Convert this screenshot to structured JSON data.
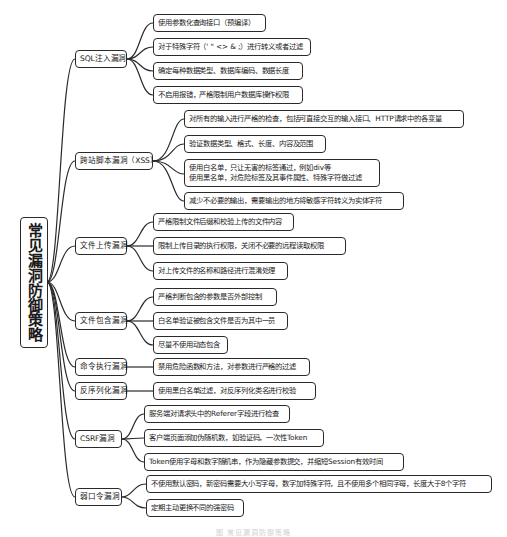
{
  "root": {
    "label": "常见漏洞防御策略"
  },
  "categories": [
    {
      "label": "SQL注入漏洞",
      "items": [
        "使用参数化查询接口（预编译）",
        "对于特殊字符（' \" <> & ;）进行转义或者过滤",
        "确定每种数据类型、数据库编码、数据长度",
        "不启用报错，严格限制用户数据库操作权限"
      ]
    },
    {
      "label": "跨站脚本漏洞（XSS）",
      "items": [
        "对所有的输入进行严格的检查，包括可直接交互的输入接口、HTTP请求中的各变量",
        "验证数据类型、格式、长度、内容及范围",
        "使用白名单，只让无害的标签通过，例如div等",
        "使用黑名单，对危险标签及其事件属性、特殊字符做过滤",
        "减少不必要的输出，需要输出的地方将敏感字符转义为实体字符"
      ]
    },
    {
      "label": "文件上传漏洞",
      "items": [
        "严格限制文件后缀和校验上传的文件内容",
        "限制上传目录的执行权限，关闭不必要的远程读取权限",
        "对上传文件的名称和路径进行混淆处理"
      ]
    },
    {
      "label": "文件包含漏洞",
      "items": [
        "严格判断包含的参数是否外部控制",
        "白名单验证被包含文件是否为其中一员",
        "尽量不使用动态包含"
      ]
    },
    {
      "label": "命令执行漏洞",
      "items": [
        "禁用危险函数和方法，对参数进行严格的过滤"
      ]
    },
    {
      "label": "反序列化漏洞",
      "items": [
        "使用黑白名单过滤，对反序列化类名进行校验"
      ]
    },
    {
      "label": "CSRF漏洞",
      "items": [
        "服务端对请求头中的Referer字段进行检查",
        "客户端页面添加伪随机数，如验证码，一次性Token",
        "Token使用字母和数字随机串，作为隐藏参数提交，并缩短Session有效时间"
      ]
    },
    {
      "label": "弱口令漏洞",
      "items": [
        "不使用默认密码，新密码需要大小写字母，数字加特殊字符，且不使用多个相同字母，长度大于8个字符",
        "定期主动更换不同的强密码"
      ]
    }
  ],
  "caption": "图 常见漏洞防御策略",
  "colors": {
    "border": "#2a2a2a",
    "background": "#ffffff",
    "text": "#1a1a1a"
  }
}
